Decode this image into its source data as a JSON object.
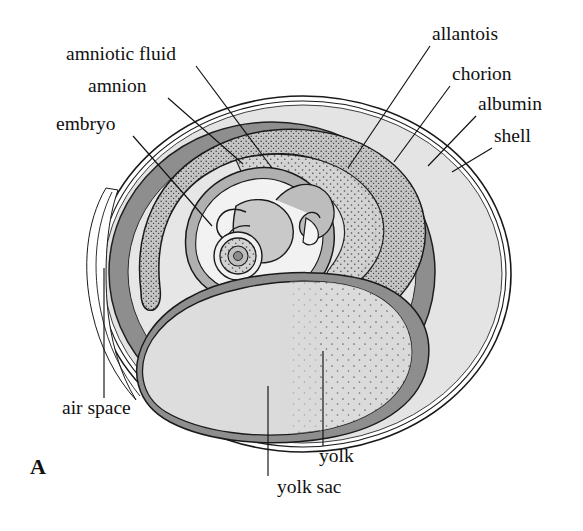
{
  "figure": {
    "panel_letter": "A",
    "background_color": "#ffffff",
    "ink_color": "#111111"
  },
  "labels": [
    {
      "id": "amniotic-fluid",
      "text": "amniotic fluid",
      "text_x": 66,
      "text_y": 60,
      "anchor": "start",
      "leader": [
        [
          196,
          66
        ],
        [
          272,
          168
        ]
      ]
    },
    {
      "id": "amnion",
      "text": "amnion",
      "text_x": 88,
      "text_y": 92,
      "anchor": "start",
      "leader": [
        [
          168,
          98
        ],
        [
          243,
          164
        ]
      ]
    },
    {
      "id": "embryo",
      "text": "embryo",
      "text_x": 56,
      "text_y": 130,
      "anchor": "start",
      "leader": [
        [
          133,
          136
        ],
        [
          212,
          226
        ]
      ]
    },
    {
      "id": "allantois",
      "text": "allantois",
      "text_x": 432,
      "text_y": 40,
      "anchor": "start",
      "leader": [
        [
          430,
          46
        ],
        [
          348,
          168
        ]
      ]
    },
    {
      "id": "chorion",
      "text": "chorion",
      "text_x": 452,
      "text_y": 80,
      "anchor": "start",
      "leader": [
        [
          450,
          86
        ],
        [
          394,
          162
        ]
      ]
    },
    {
      "id": "albumin",
      "text": "albumin",
      "text_x": 478,
      "text_y": 110,
      "anchor": "start",
      "leader": [
        [
          476,
          116
        ],
        [
          428,
          166
        ]
      ]
    },
    {
      "id": "shell",
      "text": "shell",
      "text_x": 494,
      "text_y": 142,
      "anchor": "start",
      "leader": [
        [
          492,
          148
        ],
        [
          452,
          172
        ]
      ]
    },
    {
      "id": "air-space",
      "text": "air space",
      "text_x": 62,
      "text_y": 414,
      "anchor": "start",
      "leader": [
        [
          104,
          398
        ],
        [
          104,
          268
        ]
      ]
    },
    {
      "id": "yolk-sac",
      "text": "yolk sac",
      "text_x": 277,
      "text_y": 493,
      "anchor": "start",
      "leader": [
        [
          268,
          476
        ],
        [
          268,
          386
        ]
      ]
    },
    {
      "id": "yolk",
      "text": "yolk",
      "text_x": 319,
      "text_y": 462,
      "anchor": "start",
      "leader": [
        [
          323,
          446
        ],
        [
          323,
          351
        ]
      ]
    }
  ],
  "structures": {
    "shell": {
      "name": "shell",
      "color": "#ffffff",
      "stroke": "#1a1a1a"
    },
    "albumin": {
      "name": "albumin",
      "color": "#e4e4e4"
    },
    "chorion": {
      "name": "chorion",
      "color": "#8e8e8e"
    },
    "allantois": {
      "name": "allantois",
      "color": "#bdbdbd"
    },
    "amnion": {
      "name": "amnion",
      "color": "#b0b0b0"
    },
    "amniotic_fluid": {
      "name": "amniotic fluid",
      "color": "#f2f2f2"
    },
    "embryo": {
      "name": "embryo",
      "color": "#c9c9c9"
    },
    "yolk_sac": {
      "name": "yolk sac",
      "color": "#8e8e8e"
    },
    "yolk": {
      "name": "yolk",
      "color": "#dcdcdc"
    },
    "air_space": {
      "name": "air space",
      "color": "#ffffff"
    }
  }
}
